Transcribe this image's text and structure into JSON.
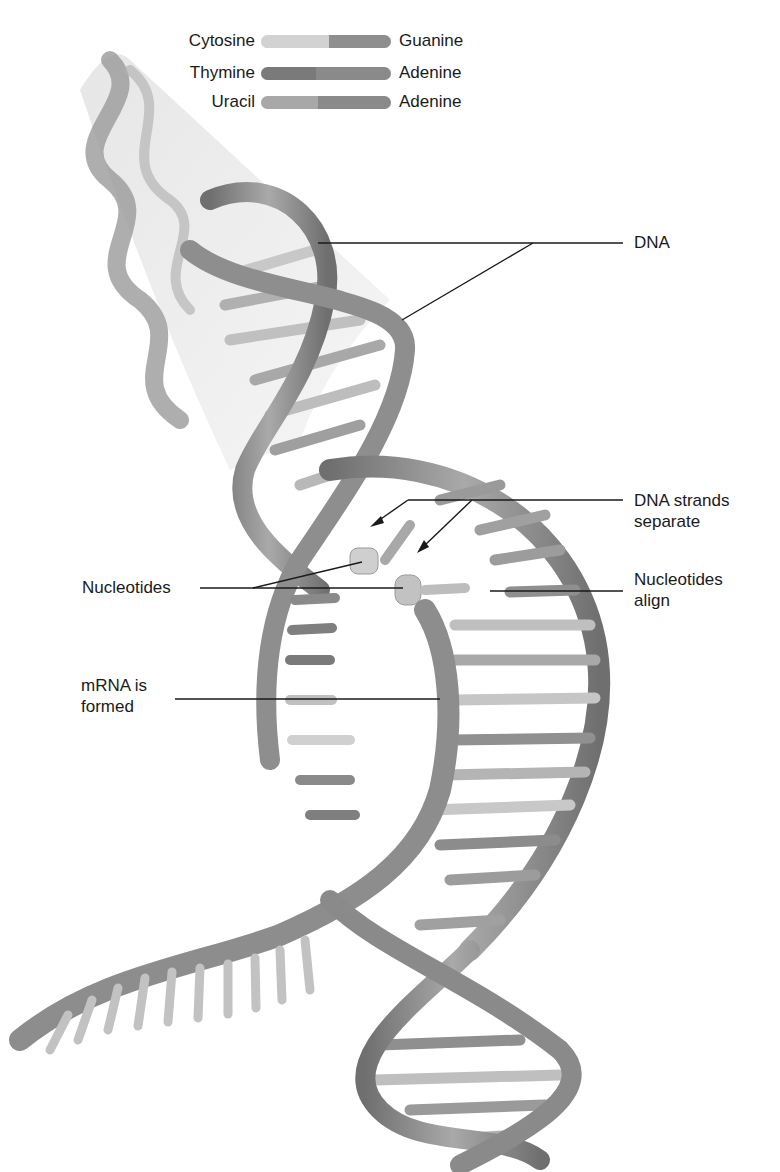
{
  "legend": {
    "rows": [
      {
        "left": "Cytosine",
        "right": "Guanine",
        "left_color": "#d2d2d2",
        "right_color": "#8e8e8e",
        "split_pct": 52
      },
      {
        "left": "Thymine",
        "right": "Adenine",
        "left_color": "#7a7a7a",
        "right_color": "#8a8a8a",
        "split_pct": 42
      },
      {
        "left": "Uracil",
        "right": "Adenine",
        "left_color": "#a8a8a8",
        "right_color": "#8a8a8a",
        "split_pct": 44
      }
    ]
  },
  "labels": {
    "dna": "DNA",
    "dna_strands_separate_line1": "DNA strands",
    "dna_strands_separate_line2": "separate",
    "nucleotides_left": "Nucleotides",
    "nucleotides_align_line1": "Nucleotides",
    "nucleotides_align_line2": "align",
    "mrna_line1": "mRNA is",
    "mrna_line2": "formed"
  },
  "colors": {
    "strand": "#8c8c8c",
    "strand_dark": "#6e6e6e",
    "rung_light": "#cfcfcf",
    "rung_dark": "#8a8a8a",
    "leader": "#1a1a1a"
  }
}
